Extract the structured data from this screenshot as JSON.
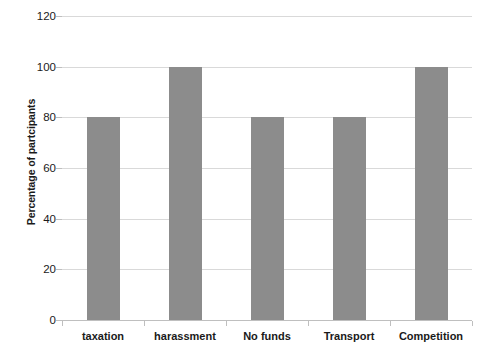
{
  "chart_data": {
    "type": "bar",
    "title": "",
    "subtitle": "",
    "xlabel": "",
    "ylabel": "Percentage of partcipants",
    "categories": [
      "taxation",
      "harassment",
      "No funds",
      "Transport",
      "Competition"
    ],
    "values": [
      80,
      100,
      80,
      80,
      100
    ],
    "series": [
      {
        "name": "Percentage of partcipants",
        "values": [
          80,
          100,
          80,
          80,
          100
        ]
      }
    ],
    "ylim": [
      0,
      120
    ],
    "y_ticks": [
      0,
      20,
      40,
      60,
      80,
      100,
      120
    ],
    "y_tick_labels": [
      "0",
      "20",
      "40",
      "60",
      "80",
      "100",
      "120"
    ],
    "grid": "horizontal",
    "legend": "none",
    "bar_color": "#8c8c8c",
    "gridline_color": "#d9d9d9",
    "axis_color": "#bfbfbf",
    "text_color": "#1a1a1a",
    "background_color": "#ffffff"
  }
}
